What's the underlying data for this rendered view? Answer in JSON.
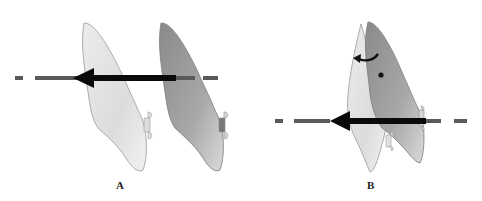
{
  "figure": {
    "panels": [
      {
        "id": "A",
        "label": "A",
        "description": "Translation: force through center of resistance"
      },
      {
        "id": "B",
        "label": "B",
        "description": "Rotation: force offset from center of resistance"
      }
    ],
    "colors": {
      "background": "#ffffff",
      "tooth_light": "#e6e6e6",
      "tooth_dark": "#9a9a9a",
      "outline": "#8c8c8c",
      "dashed_line": "#5a5a5a",
      "force_arrow": "#0a0a0a"
    }
  }
}
